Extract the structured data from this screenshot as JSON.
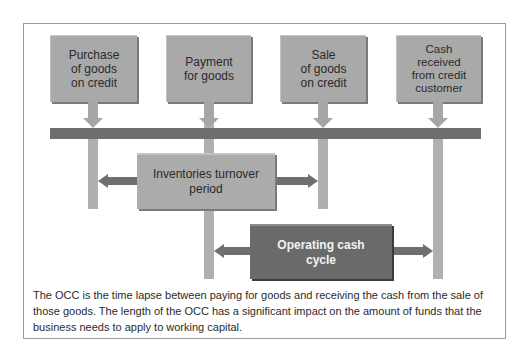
{
  "diagram": {
    "events": [
      {
        "label": "Purchase of goods on credit",
        "lines": [
          "Purchase",
          "of goods",
          "on credit"
        ]
      },
      {
        "label": "Payment for goods",
        "lines": [
          "Payment",
          "for goods"
        ]
      },
      {
        "label": "Sale of goods on credit",
        "lines": [
          "Sale",
          "of goods",
          "on credit"
        ]
      },
      {
        "label": "Cash received from credit customer",
        "lines": [
          "Cash",
          "received",
          "from credit",
          "customer"
        ]
      }
    ],
    "periods": {
      "inventories": {
        "lines": [
          "Inventories turnover",
          "period"
        ]
      },
      "occ": {
        "lines": [
          "Operating cash",
          "cycle"
        ]
      }
    },
    "colors": {
      "event_box": "#a9a9a9",
      "timeline_bar": "#6e6e6e",
      "vertical_line": "#b0b0b0",
      "occ_box": "#6a6a6a",
      "arrow": "#6f6f6f"
    }
  },
  "caption": {
    "text": "The OCC is the time lapse between paying for goods and receiving the cash from the sale of those goods. The length of the OCC has a significant impact on the amount of funds that the business needs to apply to working capital."
  }
}
